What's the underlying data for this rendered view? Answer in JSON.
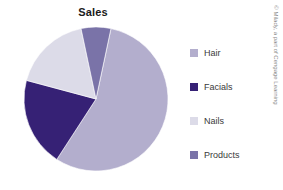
{
  "chart_data": {
    "type": "pie",
    "title": "Sales",
    "xlabel": "",
    "ylabel": "",
    "legend_position": "right",
    "grid": false,
    "categories": [
      "Hair",
      "Facials",
      "Nails",
      "Products"
    ],
    "values": [
      56,
      20,
      17,
      7
    ],
    "colors": [
      "#b3aecd",
      "#362175",
      "#dcdbe8",
      "#7a73a8"
    ],
    "slices": [
      {
        "label": "Hair",
        "value": 56,
        "color": "#b3aecd",
        "start_angle": 12,
        "end_angle": 213
      },
      {
        "label": "Facials",
        "value": 20,
        "color": "#362175",
        "start_angle": 213,
        "end_angle": 285
      },
      {
        "label": "Nails",
        "value": 17,
        "color": "#dcdbe8",
        "start_angle": 285,
        "end_angle": 348
      },
      {
        "label": "Products",
        "value": 7,
        "color": "#7a73a8",
        "start_angle": 348,
        "end_angle": 372
      }
    ],
    "geometry": {
      "cx": 96,
      "cy": 99,
      "r": 72
    }
  },
  "title": "Sales",
  "legend": {
    "items": [
      {
        "label": "Hair",
        "color": "#b3aecd"
      },
      {
        "label": "Facials",
        "color": "#362175"
      },
      {
        "label": "Nails",
        "color": "#dcdbe8"
      },
      {
        "label": "Products",
        "color": "#7a73a8"
      }
    ]
  },
  "credit": {
    "text": "© Milady, a part of Cengage Learning"
  }
}
